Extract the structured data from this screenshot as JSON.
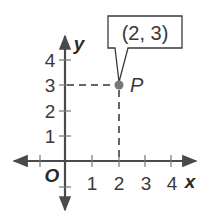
{
  "diagram": {
    "type": "coordinate-plane",
    "axes": {
      "x_label": "x",
      "y_label": "y",
      "origin_label": "O",
      "x_ticks": [
        "1",
        "2",
        "3",
        "4"
      ],
      "y_ticks": [
        "1",
        "2",
        "3",
        "4"
      ]
    },
    "point": {
      "name": "P",
      "x": 2,
      "y": 3,
      "callout": "(2, 3)"
    },
    "colors": {
      "axis": "#4a4a4a",
      "point": "#777777",
      "dashes": "#666666",
      "text": "#3a3a3a"
    }
  }
}
